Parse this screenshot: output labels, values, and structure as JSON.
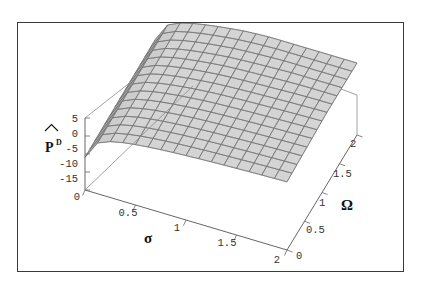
{
  "figure": {
    "type": "surface3d",
    "border_color": "#3a3a3a",
    "background": "#ffffff"
  },
  "axes": {
    "vertical": {
      "label_base": "P",
      "label_accent": "^",
      "label_superscript": "D",
      "ticks": [
        "5",
        "0",
        "-5",
        "-10",
        "-15"
      ],
      "values": [
        5,
        0,
        -5,
        -10,
        -15
      ],
      "range": [
        -15,
        5
      ]
    },
    "sigma": {
      "label": "σ",
      "ticks": [
        "0",
        "0.5",
        "1",
        "1.5",
        "2"
      ],
      "values": [
        0,
        0.5,
        1,
        1.5,
        2
      ],
      "range": [
        0,
        2
      ]
    },
    "omega": {
      "label": "Ω",
      "ticks": [
        "0",
        "0.5",
        "1",
        "1.5",
        "2"
      ],
      "values": [
        0,
        0.5,
        1,
        1.5,
        2
      ],
      "range": [
        0,
        2
      ]
    }
  },
  "surface": {
    "face_color": "#c8c8c8",
    "mesh_color": "#808080",
    "dark_region_color": "#4a4a4a",
    "mesh_nx": 16,
    "mesh_ny": 14
  },
  "chart_data": {
    "type": "surface",
    "title": "",
    "xlabel": "σ",
    "ylabel": "Ω",
    "zlabel": "P̂^D",
    "xlim": [
      0,
      2
    ],
    "ylim": [
      0,
      2
    ],
    "zlim": [
      -15,
      5
    ],
    "xticks": [
      0,
      0.5,
      1,
      1.5,
      2
    ],
    "yticks": [
      0,
      0.5,
      1,
      1.5,
      2
    ],
    "zticks": [
      -15,
      -10,
      -5,
      0,
      5
    ],
    "grid": true,
    "legend": "none",
    "x": [
      0.0,
      0.125,
      0.25,
      0.375,
      0.5,
      0.625,
      0.75,
      0.875,
      1.0,
      1.125,
      1.25,
      1.375,
      1.5,
      1.625,
      1.75,
      1.875,
      2.0
    ],
    "y": [
      0.0,
      0.1538,
      0.3077,
      0.4615,
      0.6154,
      0.7692,
      0.9231,
      1.0769,
      1.2308,
      1.3846,
      1.5385,
      1.6923,
      1.8462,
      2.0
    ],
    "z": [
      [
        -15.0,
        -14.6,
        -14.2,
        -13.8,
        -13.4,
        -13.0,
        -12.6,
        -12.2,
        -11.8,
        -11.4,
        -11.0,
        -10.6,
        -10.2,
        -9.8
      ],
      [
        -8.4,
        -8.0,
        -7.6,
        -7.2,
        -6.8,
        -6.4,
        -6.0,
        -5.6,
        -5.2,
        -4.9,
        -4.6,
        -4.3,
        -4.0,
        -3.7
      ],
      [
        -4.2,
        -3.8,
        -3.4,
        -3.0,
        -2.6,
        -2.3,
        -2.0,
        -1.7,
        -1.4,
        -1.1,
        -0.9,
        -0.7,
        -0.5,
        -0.3
      ],
      [
        -2.1,
        -1.8,
        -1.5,
        -1.2,
        -0.9,
        -0.6,
        -0.4,
        -0.2,
        0.0,
        0.2,
        0.4,
        0.6,
        0.8,
        1.0
      ],
      [
        -1.0,
        -0.7,
        -0.4,
        -0.1,
        0.2,
        0.4,
        0.6,
        0.8,
        1.0,
        1.2,
        1.4,
        1.6,
        1.8,
        2.0
      ],
      [
        -0.3,
        0.0,
        0.3,
        0.6,
        0.8,
        1.0,
        1.2,
        1.4,
        1.6,
        1.8,
        2.0,
        2.2,
        2.4,
        2.6
      ],
      [
        0.2,
        0.5,
        0.8,
        1.0,
        1.2,
        1.4,
        1.6,
        1.8,
        2.0,
        2.2,
        2.4,
        2.6,
        2.8,
        3.0
      ],
      [
        0.6,
        0.9,
        1.1,
        1.3,
        1.5,
        1.7,
        1.9,
        2.1,
        2.3,
        2.5,
        2.7,
        2.9,
        3.1,
        3.3
      ],
      [
        0.9,
        1.2,
        1.4,
        1.6,
        1.8,
        2.0,
        2.2,
        2.4,
        2.6,
        2.8,
        3.0,
        3.2,
        3.4,
        3.6
      ],
      [
        1.2,
        1.4,
        1.6,
        1.8,
        2.0,
        2.2,
        2.4,
        2.6,
        2.8,
        3.0,
        3.2,
        3.4,
        3.6,
        3.8
      ],
      [
        1.4,
        1.6,
        1.8,
        2.0,
        2.2,
        2.4,
        2.6,
        2.8,
        3.0,
        3.2,
        3.4,
        3.6,
        3.8,
        4.0
      ],
      [
        1.6,
        1.8,
        2.0,
        2.2,
        2.4,
        2.6,
        2.8,
        3.0,
        3.2,
        3.4,
        3.6,
        3.8,
        4.0,
        4.1
      ],
      [
        1.8,
        2.0,
        2.2,
        2.4,
        2.6,
        2.8,
        3.0,
        3.2,
        3.4,
        3.6,
        3.8,
        4.0,
        4.1,
        4.2
      ],
      [
        1.9,
        2.1,
        2.3,
        2.5,
        2.7,
        2.9,
        3.1,
        3.3,
        3.5,
        3.7,
        3.9,
        4.1,
        4.2,
        4.3
      ],
      [
        2.0,
        2.2,
        2.4,
        2.6,
        2.8,
        3.0,
        3.2,
        3.4,
        3.6,
        3.8,
        4.0,
        4.2,
        4.3,
        4.4
      ],
      [
        2.1,
        2.3,
        2.5,
        2.7,
        2.9,
        3.1,
        3.3,
        3.5,
        3.7,
        3.9,
        4.1,
        4.3,
        4.4,
        4.5
      ],
      [
        2.2,
        2.4,
        2.6,
        2.8,
        3.0,
        3.2,
        3.4,
        3.6,
        3.8,
        4.0,
        4.2,
        4.4,
        4.5,
        4.6
      ]
    ]
  }
}
